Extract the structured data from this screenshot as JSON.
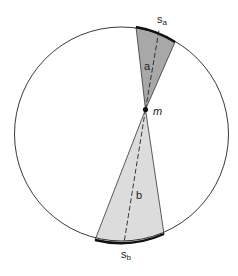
{
  "diagram": {
    "circle": {
      "cx": 121.5,
      "cy": 134,
      "r": 107,
      "stroke": "#222222"
    },
    "point_m": {
      "x": 145.5,
      "y": 109.5,
      "label": "m"
    },
    "wedge_a": {
      "label": "a",
      "arc_label": "s",
      "arc_subscript": "a",
      "fill": "#a8a8a8",
      "edge1": {
        "x": 136,
        "y": 27
      },
      "edge2": {
        "x": 175,
        "y": 42
      },
      "dashed_end": {
        "x": 159,
        "y": 30
      }
    },
    "wedge_b": {
      "label": "b",
      "arc_label": "s",
      "arc_subscript": "b",
      "fill": "#dcdcdc",
      "edge1": {
        "x": 95,
        "y": 240
      },
      "edge2": {
        "x": 164,
        "y": 234
      },
      "dashed_end": {
        "x": 124,
        "y": 243
      }
    }
  }
}
